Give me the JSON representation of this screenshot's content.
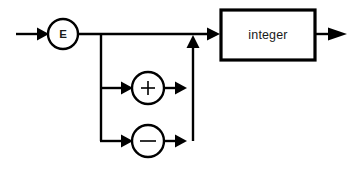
{
  "diagram": {
    "kind": "railroad-syntax-diagram",
    "canvas": {
      "width": 364,
      "height": 181,
      "background": "#ffffff"
    },
    "style": {
      "stroke_color": "#000000",
      "text_color": "#1a1a1a",
      "fill_color": "#ffffff",
      "line_width": 2,
      "box_line_width": 3,
      "circle_line_width": 2.4
    },
    "nodes": [
      {
        "id": "node-e",
        "shape": "circle",
        "label": "E",
        "cx": 63,
        "cy": 34,
        "r": 15
      },
      {
        "id": "node-plus",
        "shape": "circle",
        "label": "+",
        "cx": 148,
        "cy": 88,
        "r": 16
      },
      {
        "id": "node-minus",
        "shape": "circle",
        "label": "−",
        "cx": 148,
        "cy": 141,
        "r": 16
      },
      {
        "id": "node-integer",
        "shape": "rect",
        "label": "integer",
        "x": 221,
        "y": 10,
        "width": 94,
        "height": 50
      }
    ],
    "rails": {
      "entry_arrow_label": "entry",
      "exit_arrow_label": "exit",
      "main_baseline_y": 34,
      "branch_left_x": 101,
      "branch_right_x": 193,
      "plus_row_y": 88,
      "minus_row_y": 141
    },
    "annotations": {
      "reads": "E  followed by optional + or - followed by integer"
    }
  }
}
